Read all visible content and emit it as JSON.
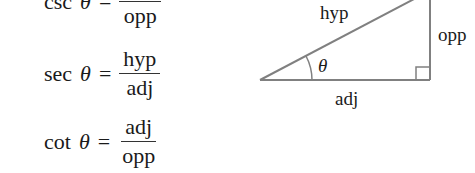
{
  "equations": [
    {
      "fn": "csc",
      "var": "θ",
      "op": "=",
      "numerator": "",
      "denominator": "opp"
    },
    {
      "fn": "sec",
      "var": "θ",
      "op": "=",
      "numerator": "hyp",
      "denominator": "adj"
    },
    {
      "fn": "cot",
      "var": "θ",
      "op": "=",
      "numerator": "adj",
      "denominator": "opp"
    }
  ],
  "triangle": {
    "hypotenuse_label": "hyp",
    "opposite_label": "opp",
    "adjacent_label": "adj",
    "angle_label": "θ",
    "line_color": "#808080"
  }
}
